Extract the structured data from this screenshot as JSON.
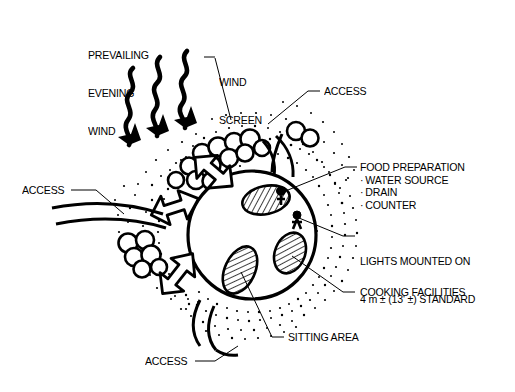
{
  "diagram": {
    "type": "site-plan",
    "title_absent": true,
    "background_color": "#ffffff",
    "ink_color": "#000000"
  },
  "labels": {
    "prevailing_wind": "PREVAILING\nEVENING\nWIND",
    "prevailing_wind_lines": [
      "PREVAILING",
      "EVENING",
      "WIND"
    ],
    "wind_screen": "WIND\nSCREEN",
    "wind_screen_lines": [
      "WIND",
      "SCREEN"
    ],
    "access_top": "ACCESS",
    "access_left": "ACCESS",
    "access_bottom": "ACCESS",
    "food_preparation_heading": "FOOD PREPARATION",
    "food_preparation_items": [
      "WATER SOURCE",
      "DRAIN",
      "COUNTER"
    ],
    "lights_line1": "LIGHTS MOUNTED ON",
    "lights_line2": "4 m ± (13' ±) STANDARD",
    "cooking_facilities": "COOKING FACILITIES",
    "sitting_area": "SITTING AREA"
  },
  "elements": {
    "plaza_circle": "central paved circle",
    "boulder_clusters": "rounded boulder groups forming wind screen",
    "stipple_ground": "stippled gravel ground texture",
    "inward_arrows": "hollow outline arrows marking access into plaza",
    "wind_arrows": "three wavy arrows indicating prevailing evening wind",
    "hatched_areas": "hatched ellipses for sitting and cooking facilities",
    "figures": "small human figures at food preparation counter"
  }
}
